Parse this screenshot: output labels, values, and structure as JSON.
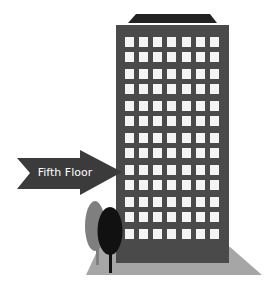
{
  "illustration": {
    "subject": "office-building",
    "arrow": {
      "label": "Fifth Floor",
      "color": "#3b3b3b",
      "text_color": "#ffffff"
    },
    "building": {
      "color": "#4a4a4a",
      "roof_color": "#222222",
      "window_color": "#f4f4f4",
      "window_columns": 7,
      "window_rows": 13
    },
    "ground": {
      "color": "#a6a6a6"
    },
    "trees": [
      {
        "name": "back-tree",
        "color": "#7f7f7f"
      },
      {
        "name": "front-tree",
        "color": "#111111"
      }
    ]
  }
}
